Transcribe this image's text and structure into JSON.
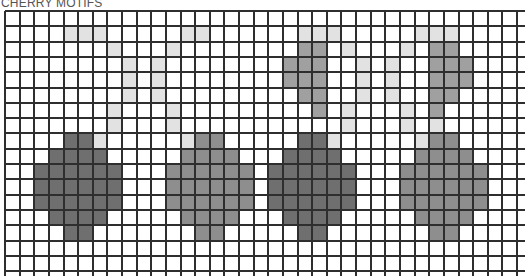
{
  "title": "CHERRY MOTIFS",
  "grid": {
    "columns": 35,
    "rows": 17,
    "cell_width": 14.63,
    "cell_height": 15.3,
    "line_color": "#2e2e2e"
  },
  "palette": {
    "dark": "#6f6f6f",
    "medium": "#8e8e8e",
    "leaf": "#a0a0a0",
    "light": "#e2e2e2"
  },
  "motifs": [
    {
      "name": "cherry-1",
      "tone": "dark",
      "cells": [
        [
          8,
          4
        ],
        [
          8,
          5
        ],
        [
          9,
          3
        ],
        [
          9,
          4
        ],
        [
          9,
          5
        ],
        [
          9,
          6
        ],
        [
          10,
          2
        ],
        [
          10,
          3
        ],
        [
          10,
          4
        ],
        [
          10,
          5
        ],
        [
          10,
          6
        ],
        [
          10,
          7
        ],
        [
          11,
          2
        ],
        [
          11,
          3
        ],
        [
          11,
          4
        ],
        [
          11,
          5
        ],
        [
          11,
          6
        ],
        [
          11,
          7
        ],
        [
          12,
          2
        ],
        [
          12,
          3
        ],
        [
          12,
          4
        ],
        [
          12,
          5
        ],
        [
          12,
          6
        ],
        [
          12,
          7
        ],
        [
          13,
          3
        ],
        [
          13,
          4
        ],
        [
          13,
          5
        ],
        [
          13,
          6
        ],
        [
          14,
          4
        ],
        [
          14,
          5
        ]
      ],
      "stem": [
        [
          1,
          4
        ],
        [
          1,
          5
        ],
        [
          1,
          6
        ],
        [
          2,
          7
        ],
        [
          3,
          8
        ],
        [
          4,
          8
        ],
        [
          5,
          8
        ],
        [
          6,
          7
        ],
        [
          7,
          7
        ],
        [
          8,
          6
        ]
      ]
    },
    {
      "name": "cherry-2",
      "tone": "medium",
      "cells": [
        [
          8,
          13
        ],
        [
          8,
          14
        ],
        [
          9,
          12
        ],
        [
          9,
          13
        ],
        [
          9,
          14
        ],
        [
          9,
          15
        ],
        [
          10,
          11
        ],
        [
          10,
          12
        ],
        [
          10,
          13
        ],
        [
          10,
          14
        ],
        [
          10,
          15
        ],
        [
          10,
          16
        ],
        [
          11,
          11
        ],
        [
          11,
          12
        ],
        [
          11,
          13
        ],
        [
          11,
          14
        ],
        [
          11,
          15
        ],
        [
          11,
          16
        ],
        [
          12,
          11
        ],
        [
          12,
          12
        ],
        [
          12,
          13
        ],
        [
          12,
          14
        ],
        [
          12,
          15
        ],
        [
          12,
          16
        ],
        [
          13,
          12
        ],
        [
          13,
          13
        ],
        [
          13,
          14
        ],
        [
          13,
          15
        ],
        [
          14,
          13
        ],
        [
          14,
          14
        ]
      ],
      "stem": [
        [
          1,
          12
        ],
        [
          1,
          13
        ],
        [
          2,
          11
        ],
        [
          3,
          10
        ],
        [
          4,
          10
        ],
        [
          5,
          10
        ],
        [
          6,
          11
        ],
        [
          7,
          11
        ],
        [
          8,
          12
        ]
      ]
    },
    {
      "name": "cherry-3",
      "tone": "dark",
      "cells": [
        [
          8,
          20
        ],
        [
          8,
          21
        ],
        [
          9,
          19
        ],
        [
          9,
          20
        ],
        [
          9,
          21
        ],
        [
          9,
          22
        ],
        [
          10,
          18
        ],
        [
          10,
          19
        ],
        [
          10,
          20
        ],
        [
          10,
          21
        ],
        [
          10,
          22
        ],
        [
          10,
          23
        ],
        [
          11,
          18
        ],
        [
          11,
          19
        ],
        [
          11,
          20
        ],
        [
          11,
          21
        ],
        [
          11,
          22
        ],
        [
          11,
          23
        ],
        [
          12,
          18
        ],
        [
          12,
          19
        ],
        [
          12,
          20
        ],
        [
          12,
          21
        ],
        [
          12,
          22
        ],
        [
          12,
          23
        ],
        [
          13,
          19
        ],
        [
          13,
          20
        ],
        [
          13,
          21
        ],
        [
          13,
          22
        ],
        [
          14,
          20
        ],
        [
          14,
          21
        ]
      ],
      "stem": [
        [
          1,
          20
        ],
        [
          1,
          21
        ],
        [
          1,
          22
        ],
        [
          2,
          23
        ],
        [
          3,
          24
        ],
        [
          4,
          24
        ],
        [
          5,
          24
        ],
        [
          6,
          23
        ],
        [
          7,
          23
        ],
        [
          8,
          22
        ]
      ],
      "leaf": [
        [
          2,
          20
        ],
        [
          2,
          21
        ],
        [
          3,
          19
        ],
        [
          3,
          20
        ],
        [
          3,
          21
        ],
        [
          4,
          19
        ],
        [
          4,
          20
        ],
        [
          4,
          21
        ],
        [
          5,
          20
        ],
        [
          5,
          21
        ],
        [
          6,
          21
        ]
      ]
    },
    {
      "name": "cherry-4",
      "tone": "medium",
      "cells": [
        [
          8,
          29
        ],
        [
          8,
          30
        ],
        [
          9,
          28
        ],
        [
          9,
          29
        ],
        [
          9,
          30
        ],
        [
          9,
          31
        ],
        [
          10,
          27
        ],
        [
          10,
          28
        ],
        [
          10,
          29
        ],
        [
          10,
          30
        ],
        [
          10,
          31
        ],
        [
          10,
          32
        ],
        [
          11,
          27
        ],
        [
          11,
          28
        ],
        [
          11,
          29
        ],
        [
          11,
          30
        ],
        [
          11,
          31
        ],
        [
          11,
          32
        ],
        [
          12,
          27
        ],
        [
          12,
          28
        ],
        [
          12,
          29
        ],
        [
          12,
          30
        ],
        [
          12,
          31
        ],
        [
          12,
          32
        ],
        [
          13,
          28
        ],
        [
          13,
          29
        ],
        [
          13,
          30
        ],
        [
          13,
          31
        ],
        [
          14,
          29
        ],
        [
          14,
          30
        ]
      ],
      "stem": [
        [
          1,
          28
        ],
        [
          1,
          29
        ],
        [
          1,
          30
        ],
        [
          2,
          27
        ],
        [
          3,
          26
        ],
        [
          4,
          26
        ],
        [
          5,
          26
        ],
        [
          6,
          27
        ],
        [
          7,
          27
        ],
        [
          7,
          29
        ],
        [
          8,
          28
        ]
      ],
      "leaf": [
        [
          2,
          29
        ],
        [
          2,
          30
        ],
        [
          3,
          29
        ],
        [
          3,
          30
        ],
        [
          3,
          31
        ],
        [
          4,
          29
        ],
        [
          4,
          30
        ],
        [
          4,
          31
        ],
        [
          5,
          29
        ],
        [
          5,
          30
        ],
        [
          6,
          29
        ]
      ]
    }
  ]
}
